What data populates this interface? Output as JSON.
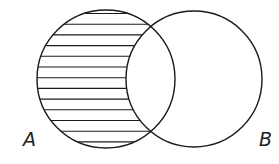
{
  "diagram": {
    "type": "venn",
    "sets": [
      {
        "label": "A",
        "cx": 106,
        "cy": 79,
        "r": 69
      },
      {
        "label": "B",
        "cx": 194,
        "cy": 79,
        "r": 68
      }
    ],
    "shaded_region": "A minus B",
    "hatch": {
      "style": "horizontal",
      "spacing": 10.7,
      "first_y": 13.5
    }
  },
  "labels": {
    "a": "A",
    "b": "B"
  },
  "colors": {
    "stroke": "#1a1a1a",
    "background": "#ffffff"
  }
}
